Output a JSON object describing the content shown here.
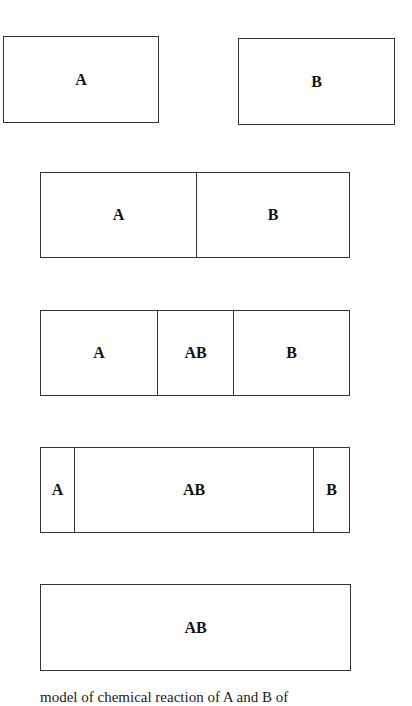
{
  "diagram": {
    "stages": [
      {
        "id": "separate",
        "boxes": [
          {
            "cells": [
              {
                "label": "A",
                "width": 155
              }
            ]
          },
          {
            "cells": [
              {
                "label": "B",
                "width": 156
              }
            ]
          }
        ]
      },
      {
        "id": "contact",
        "cells": [
          {
            "label": "A",
            "width": 155
          },
          {
            "label": "B",
            "width": 154
          }
        ]
      },
      {
        "id": "partial-mix",
        "cells": [
          {
            "label": "A",
            "width": 116
          },
          {
            "label": "AB",
            "width": 76
          },
          {
            "label": "B",
            "width": 117
          }
        ]
      },
      {
        "id": "mostly-mixed",
        "cells": [
          {
            "label": "A",
            "width": 33
          },
          {
            "label": "AB",
            "width": 239
          },
          {
            "label": "B",
            "width": 37
          }
        ]
      },
      {
        "id": "fully-mixed",
        "cells": [
          {
            "label": "AB",
            "width": 310
          }
        ]
      }
    ],
    "caption": "model of chemical reaction of A and B of"
  }
}
